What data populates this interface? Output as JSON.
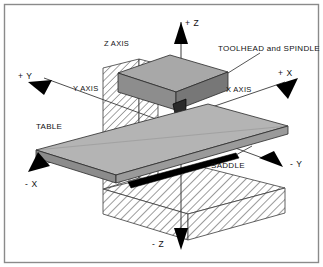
{
  "diagram": {
    "frame": {
      "border_color": "#8a8a8a",
      "background_color": "#ffffff"
    },
    "axis_labels": {
      "z_axis": "Z AXIS",
      "y_axis": "Y AXIS",
      "x_axis": "X AXIS"
    },
    "direction_labels": {
      "plus_z": "+ Z",
      "minus_z": "- Z",
      "plus_y": "+ Y",
      "minus_y": "- Y",
      "plus_x": "+ X",
      "minus_x": "- X"
    },
    "part_labels": {
      "toolhead": "TOOLHEAD and SPINDLE",
      "table": "TABLE",
      "saddle": "SADDLE"
    },
    "colors": {
      "line": "#1a1a1a",
      "arrow_fill": "#000000",
      "toolhead_top": "#a8a8a8",
      "toolhead_front": "#8d8d8d",
      "toolhead_side": "#777777",
      "table_top": "#b4b4b4",
      "table_edge": "#9a9a9a",
      "table_side": "#8c8c8c",
      "saddle": "#000000",
      "spindle": "#2a2a2a",
      "hatch_stroke": "#4a4a4a",
      "hatch_bg": "#ffffff"
    }
  }
}
